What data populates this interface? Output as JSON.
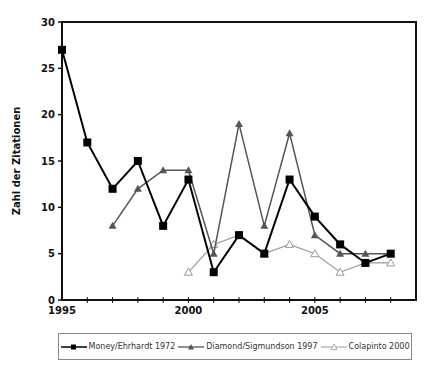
{
  "chart_data": {
    "type": "line",
    "title": "",
    "xlabel": "",
    "ylabel": "Zahl der Zitationen",
    "ylim": [
      0,
      30
    ],
    "xlim": [
      1995,
      2009
    ],
    "yticks": [
      0,
      5,
      10,
      15,
      20,
      25,
      30
    ],
    "xtick_labels": [
      "1995",
      "2000",
      "2005"
    ],
    "grid": false,
    "legend_position": "bottom",
    "series": [
      {
        "name": "Money/Ehrhardt 1972",
        "marker": "square",
        "color": "#000000",
        "x": [
          1995,
          1996,
          1997,
          1998,
          1999,
          2000,
          2001,
          2002,
          2003,
          2004,
          2005,
          2006,
          2007,
          2008
        ],
        "values": [
          27,
          17,
          12,
          15,
          8,
          13,
          3,
          7,
          5,
          13,
          9,
          6,
          4,
          5
        ]
      },
      {
        "name": "Diamond/Sigmundson 1997",
        "marker": "triangle",
        "color": "#555555",
        "x": [
          1997,
          1998,
          1999,
          2000,
          2001,
          2002,
          2003,
          2004,
          2005,
          2006,
          2007,
          2008
        ],
        "values": [
          8,
          12,
          14,
          14,
          5,
          19,
          8,
          18,
          7,
          5,
          5,
          5
        ]
      },
      {
        "name": "Colapinto 2000",
        "marker": "open-triangle",
        "color": "#999999",
        "x": [
          2000,
          2001,
          2002,
          2003,
          2004,
          2005,
          2006,
          2007,
          2008
        ],
        "values": [
          3,
          6,
          7,
          5,
          6,
          5,
          3,
          4,
          4
        ]
      }
    ]
  },
  "legend": {
    "items": [
      {
        "label": "Money/Ehrhardt 1972"
      },
      {
        "label": "Diamond/Sigmundson 1997"
      },
      {
        "label": "Colapinto 2000"
      }
    ]
  }
}
